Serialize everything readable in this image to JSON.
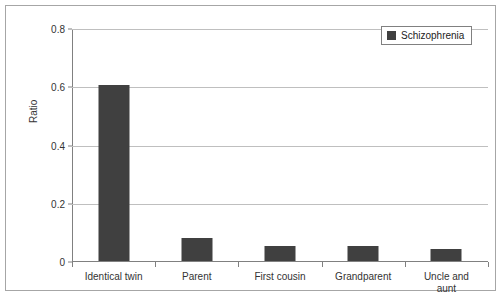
{
  "chart_data": {
    "type": "bar",
    "title": "",
    "xlabel": "",
    "ylabel": "Ratio",
    "categories": [
      "Identical twin",
      "Parent",
      "First cousin",
      "Grandparent",
      "Uncle and\naunt"
    ],
    "values": [
      0.605,
      0.08,
      0.05,
      0.05,
      0.04
    ],
    "series": [
      {
        "name": "Schizophrenia",
        "values": [
          0.605,
          0.08,
          0.05,
          0.05,
          0.04
        ]
      }
    ],
    "ylim": [
      0,
      0.8
    ],
    "yticks": [
      "0",
      "0.2",
      "0.4",
      "0.6",
      "0.8"
    ],
    "ytick_values": [
      0,
      0.2,
      0.4,
      0.6,
      0.8
    ],
    "grid": true,
    "legend": {
      "position": "top-right",
      "entries": [
        "Schizophrenia"
      ]
    },
    "colors": {
      "bar": "#404040",
      "gridline": "#bfbfbf",
      "axis": "#808080",
      "frame": "#a6a6a6",
      "background": "#ffffff",
      "text": "#333333"
    }
  },
  "legend": {
    "label": "Schizophrenia"
  },
  "axis": {
    "y_title": "Ratio"
  }
}
